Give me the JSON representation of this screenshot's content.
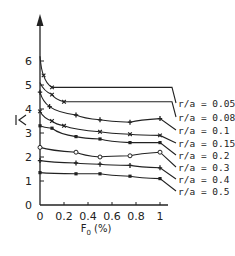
{
  "chart_data": {
    "type": "line",
    "title": "",
    "xlabel": "F0 (%)",
    "ylabel": "λ̄",
    "xlim": [
      0,
      1
    ],
    "ylim": [
      0,
      6.5
    ],
    "x_ticks": [
      "0",
      "0.2",
      "0.4",
      "0.6",
      "0.8",
      "1"
    ],
    "y_ticks": [
      "0",
      "1",
      "2",
      "3",
      "4",
      "5",
      "6"
    ],
    "grid": false,
    "legend_position": "right, inline labels at curve ends",
    "series": [
      {
        "name": "r/a = 0.05",
        "marker": "x",
        "x": [
          0,
          0.03,
          0.1,
          1.1
        ],
        "values": [
          6.2,
          5.4,
          4.9,
          4.9
        ]
      },
      {
        "name": "r/a = 0.08",
        "marker": "x",
        "x": [
          0,
          0.1,
          0.2,
          1.1
        ],
        "values": [
          5.1,
          4.6,
          4.3,
          4.3
        ]
      },
      {
        "name": "r/a = 0.1",
        "marker": "+",
        "x": [
          0,
          0.08,
          0.3,
          0.5,
          0.75,
          1.0
        ],
        "values": [
          4.7,
          4.1,
          3.75,
          3.55,
          3.45,
          3.6
        ]
      },
      {
        "name": "r/a = 0.15",
        "marker": "x",
        "x": [
          0,
          0.1,
          0.2,
          0.5,
          0.75,
          1.0
        ],
        "values": [
          3.9,
          3.5,
          3.3,
          3.05,
          2.95,
          2.9
        ]
      },
      {
        "name": "r/a = 0.2",
        "marker": "■",
        "x": [
          0,
          0.1,
          0.3,
          0.5,
          0.75,
          1.0
        ],
        "values": [
          3.3,
          3.2,
          2.85,
          2.75,
          2.6,
          2.6
        ]
      },
      {
        "name": "r/a = 0.3",
        "marker": "o",
        "x": [
          0,
          0.3,
          0.5,
          0.75,
          1.0
        ],
        "values": [
          2.4,
          2.2,
          2.0,
          2.05,
          2.2
        ]
      },
      {
        "name": "r/a = 0.4",
        "marker": "+",
        "x": [
          0,
          0.3,
          0.5,
          0.75,
          1.0
        ],
        "values": [
          1.85,
          1.75,
          1.7,
          1.65,
          1.55
        ]
      },
      {
        "name": "r/a = 0.5",
        "marker": "■",
        "x": [
          0,
          0.3,
          0.5,
          0.75,
          1.0
        ],
        "values": [
          1.35,
          1.3,
          1.3,
          1.2,
          1.1
        ]
      }
    ]
  }
}
